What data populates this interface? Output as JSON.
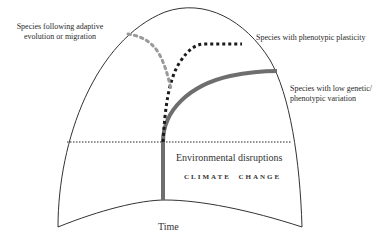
{
  "diagram": {
    "labels": {
      "adaptive": [
        "Species following adaptive",
        "evolution or migration"
      ],
      "plasticity": "Species with phenotypic plasticity",
      "low_variation": [
        "Species with low genetic/",
        "phenotypic variation"
      ],
      "environmental": "Environmental disruptions",
      "climate_change": "CLIMATE  CHANGE",
      "time": "Time"
    },
    "colors": {
      "outline": "#333333",
      "adaptive_line": "#9a9a9a",
      "plasticity_line": "#1a1a1a",
      "low_variation_line": "#6e6e6e",
      "threshold_line": "#222222"
    }
  }
}
